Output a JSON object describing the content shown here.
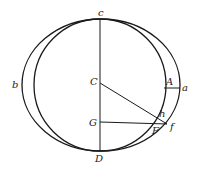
{
  "diagram": {
    "type": "geometric-construction",
    "stroke_color": "#1a1a1a",
    "background": "#ffffff",
    "labels": {
      "c": "c",
      "C": "C",
      "G": "G",
      "D": "D",
      "b": "b",
      "A": "A",
      "a": "a",
      "h": "h",
      "F": "F",
      "f": "f"
    },
    "shapes": [
      {
        "kind": "ellipse",
        "name": "outer-ellipse",
        "cx": 101,
        "cy": 85,
        "rx": 79,
        "ry": 66
      },
      {
        "kind": "circle",
        "name": "inner-circle",
        "cx": 100,
        "cy": 85,
        "r": 66
      },
      {
        "kind": "line",
        "name": "axis-cD",
        "from": "c",
        "to": "D"
      },
      {
        "kind": "line",
        "name": "radius-Cf",
        "from": "C",
        "to": "f"
      },
      {
        "kind": "line",
        "name": "ordinate-Gf",
        "from": "G",
        "to": "f"
      },
      {
        "kind": "line",
        "name": "segment-Aa",
        "from": "A",
        "to": "a"
      }
    ]
  }
}
